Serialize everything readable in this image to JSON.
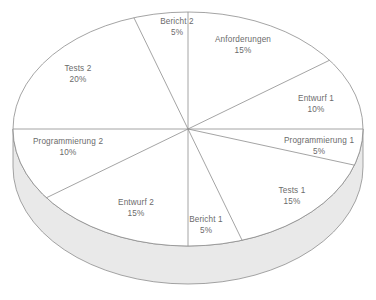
{
  "chart_data": {
    "type": "pie",
    "title": "",
    "subtitle": "",
    "xlabel": "",
    "ylabel": "",
    "legend_position": "none",
    "grid": false,
    "value_unit": "%",
    "total": 100,
    "style": "3d-pie-outline",
    "start_angle_deg": 0,
    "direction": "clockwise",
    "categories": [
      "Anforderungen",
      "Entwurf 1",
      "Programmierung 1",
      "Tests 1",
      "Bericht 1",
      "Entwurf 2",
      "Programmierung 2",
      "Tests 2",
      "Bericht 2"
    ],
    "values": [
      15,
      10,
      5,
      15,
      5,
      15,
      10,
      20,
      5
    ],
    "slices": [
      {
        "label": "Anforderungen",
        "value": 15,
        "value_label": "15%",
        "label_x": 243,
        "label_y": 45
      },
      {
        "label": "Entwurf 1",
        "value": 10,
        "value_label": "10%",
        "label_x": 316,
        "label_y": 104
      },
      {
        "label": "Programmierung 1",
        "value": 5,
        "value_label": "5%",
        "label_x": 319,
        "label_y": 146
      },
      {
        "label": "Tests 1",
        "value": 15,
        "value_label": "15%",
        "label_x": 292,
        "label_y": 196
      },
      {
        "label": "Bericht 1",
        "value": 5,
        "value_label": "5%",
        "label_x": 206,
        "label_y": 225
      },
      {
        "label": "Entwurf 2",
        "value": 15,
        "value_label": "15%",
        "label_x": 136,
        "label_y": 208
      },
      {
        "label": "Programmierung 2",
        "value": 10,
        "value_label": "10%",
        "label_x": 68,
        "label_y": 147
      },
      {
        "label": "Tests 2",
        "value": 20,
        "value_label": "20%",
        "label_x": 78,
        "label_y": 74
      },
      {
        "label": "Bericht 2",
        "value": 5,
        "value_label": "5%",
        "label_x": 177,
        "label_y": 27
      }
    ],
    "colors": {
      "top_face": "#ffffff",
      "side_face": "#e8e8e8",
      "outline": "#8a8a8a",
      "label_text": "#6b6b6b"
    }
  }
}
